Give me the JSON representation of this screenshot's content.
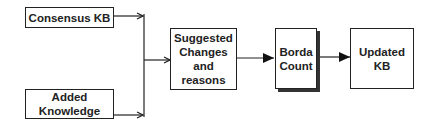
{
  "diagram": {
    "nodes": [
      {
        "id": "consensus-kb",
        "label": "Consensus KB"
      },
      {
        "id": "added-knowledge",
        "label": "Added Knowledge",
        "lines": [
          "Added",
          "Knowledge"
        ]
      },
      {
        "id": "suggested-changes",
        "label": "Suggested Changes and reasons",
        "lines": [
          "Suggested",
          "Changes",
          "and",
          "reasons"
        ]
      },
      {
        "id": "borda-count",
        "label": "Borda Count",
        "lines": [
          "Borda",
          "Count"
        ]
      },
      {
        "id": "updated-kb",
        "label": "Updated KB",
        "lines": [
          "Updated",
          "KB"
        ]
      }
    ],
    "edges": [
      {
        "from": "consensus-kb",
        "to": "suggested-changes"
      },
      {
        "from": "added-knowledge",
        "to": "suggested-changes"
      },
      {
        "from": "suggested-changes",
        "to": "borda-count"
      },
      {
        "from": "borda-count",
        "to": "updated-kb"
      }
    ],
    "colors": {
      "stroke": "#222222",
      "background": "#ffffff"
    }
  }
}
